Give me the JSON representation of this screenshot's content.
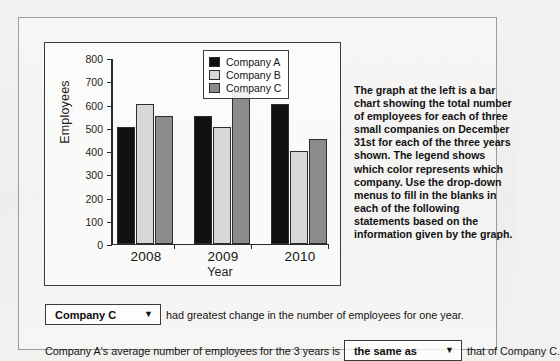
{
  "chart_data": {
    "type": "bar",
    "title": "",
    "xlabel": "Year",
    "ylabel": "Employees",
    "categories": [
      "2008",
      "2009",
      "2010"
    ],
    "series": [
      {
        "name": "Company A",
        "color": "#111111",
        "values": [
          500,
          550,
          600
        ]
      },
      {
        "name": "Company B",
        "color": "#d7d7d7",
        "values": [
          600,
          500,
          400
        ]
      },
      {
        "name": "Company C",
        "color": "#8c8c8c",
        "values": [
          550,
          650,
          450
        ]
      }
    ],
    "ylim": [
      0,
      800
    ],
    "ytick_step": 100,
    "ytick_labels": [
      "800",
      "700",
      "600",
      "500",
      "400",
      "300",
      "200",
      "100",
      "0"
    ],
    "grid": false,
    "legend_position": "top-right"
  },
  "description": {
    "text": "The graph at the left is a bar chart showing the total number of employees for each of three small companies on December 31st for each of the three years shown. The legend shows which color represents which company. Use the drop-down menus to fill in the blanks in each of the following statements based on the information given by the graph."
  },
  "statements": [
    {
      "dropdown_value": "Company C",
      "dropdown_arrow": "▼",
      "text_before": "",
      "text_after": "had greatest change in the number of employees for one year."
    },
    {
      "dropdown_value": "the same as",
      "dropdown_arrow": "▼",
      "text_before": "Company A's average number of employees for the 3 years is",
      "text_after": "that of Company C."
    }
  ]
}
